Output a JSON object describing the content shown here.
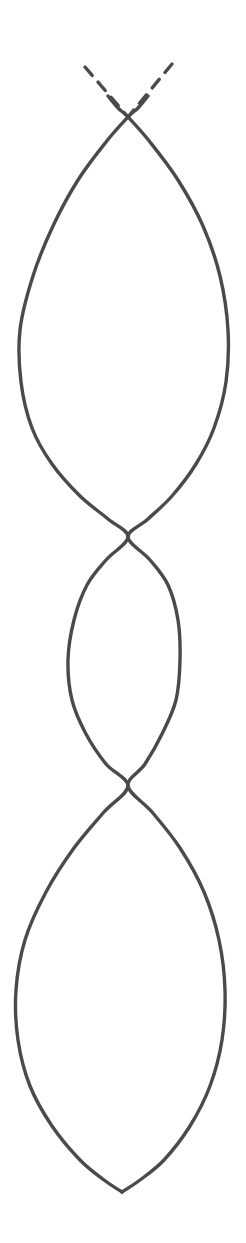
{
  "figure": {
    "title": "Two crossing curves forming three lens-shaped regions",
    "background_color": "#ffffff",
    "stroke_color": "#4a4a4a",
    "stroke_width": 3.4,
    "canvas": {
      "width": 246,
      "height": 1243
    }
  },
  "chart_data": {
    "type": "line",
    "title": "Two crossing curves forming three lens-shaped regions",
    "xlabel": "",
    "ylabel": "",
    "xlim": [
      0,
      246
    ],
    "ylim": [
      0,
      1243
    ],
    "grid": false,
    "legend": null,
    "axis_direction": "y increases downward (image coordinates)",
    "series": [
      {
        "name": "curve-left-descending",
        "style": "solid",
        "color": "#4a4a4a",
        "points": [
          [
            108,
            96
          ],
          [
            118,
            108
          ],
          [
            128,
            117
          ],
          [
            150,
            142
          ],
          [
            178,
            180
          ],
          [
            203,
            226
          ],
          [
            220,
            276
          ],
          [
            228,
            330
          ],
          [
            226,
            382
          ],
          [
            214,
            428
          ],
          [
            196,
            464
          ],
          [
            172,
            496
          ],
          [
            148,
            519
          ],
          [
            128,
            537
          ],
          [
            150,
            560
          ],
          [
            168,
            585
          ],
          [
            178,
            620
          ],
          [
            180,
            660
          ],
          [
            176,
            700
          ],
          [
            162,
            734
          ],
          [
            145,
            764
          ],
          [
            128,
            786
          ],
          [
            152,
            812
          ],
          [
            180,
            848
          ],
          [
            204,
            892
          ],
          [
            219,
            940
          ],
          [
            225,
            990
          ],
          [
            222,
            1040
          ],
          [
            210,
            1086
          ],
          [
            190,
            1126
          ],
          [
            164,
            1160
          ],
          [
            140,
            1180
          ],
          [
            122,
            1192
          ]
        ]
      },
      {
        "name": "curve-right-descending",
        "style": "solid",
        "color": "#4a4a4a",
        "points": [
          [
            148,
            96
          ],
          [
            138,
            108
          ],
          [
            128,
            117
          ],
          [
            106,
            142
          ],
          [
            78,
            180
          ],
          [
            53,
            226
          ],
          [
            33,
            276
          ],
          [
            20,
            330
          ],
          [
            21,
            382
          ],
          [
            32,
            428
          ],
          [
            52,
            464
          ],
          [
            80,
            496
          ],
          [
            108,
            519
          ],
          [
            128,
            537
          ],
          [
            106,
            560
          ],
          [
            87,
            585
          ],
          [
            74,
            620
          ],
          [
            68,
            660
          ],
          [
            72,
            700
          ],
          [
            86,
            734
          ],
          [
            106,
            764
          ],
          [
            128,
            786
          ],
          [
            104,
            812
          ],
          [
            74,
            848
          ],
          [
            46,
            892
          ],
          [
            25,
            940
          ],
          [
            16,
            990
          ],
          [
            18,
            1040
          ],
          [
            30,
            1086
          ],
          [
            52,
            1126
          ],
          [
            80,
            1160
          ],
          [
            104,
            1180
          ],
          [
            122,
            1192
          ]
        ]
      },
      {
        "name": "dashed-extension-left",
        "style": "dashed",
        "color": "#4a4a4a",
        "dash_pattern": [
          11,
          9
        ],
        "points": [
          [
            85,
            67
          ],
          [
            128,
            117
          ]
        ]
      },
      {
        "name": "dashed-extension-right",
        "style": "dashed",
        "color": "#4a4a4a",
        "dash_pattern": [
          11,
          9
        ],
        "points": [
          [
            172,
            64
          ],
          [
            128,
            117
          ]
        ]
      }
    ],
    "annotations": [
      {
        "name": "intersection-top",
        "x": 128,
        "y": 117,
        "label": ""
      },
      {
        "name": "intersection-middle",
        "x": 128,
        "y": 537,
        "label": ""
      },
      {
        "name": "intersection-lower",
        "x": 128,
        "y": 786,
        "label": ""
      },
      {
        "name": "terminal-cusp-bottom",
        "x": 122,
        "y": 1192,
        "label": ""
      }
    ],
    "regions": [
      {
        "name": "lens-upper",
        "top_y": 117,
        "bottom_y": 537,
        "widest_y": 332,
        "left_x": 20,
        "right_x": 228,
        "max_width": 208
      },
      {
        "name": "lens-middle",
        "top_y": 537,
        "bottom_y": 786,
        "widest_y": 662,
        "left_x": 68,
        "right_x": 180,
        "max_width": 112
      },
      {
        "name": "lens-lower",
        "top_y": 786,
        "bottom_y": 1192,
        "widest_y": 992,
        "left_x": 16,
        "right_x": 225,
        "max_width": 209
      }
    ]
  }
}
